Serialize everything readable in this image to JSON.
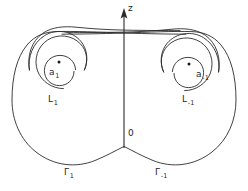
{
  "figure": {
    "kind": "contour-diagram",
    "background_color": "#ffffff",
    "stroke_color": "#2b2b2b",
    "width": 248,
    "height": 191,
    "axis": {
      "name": "z-axis",
      "label": "z",
      "origin_label": "0",
      "direction": "up",
      "has_arrowhead": true
    },
    "poles": [
      {
        "id": "a1",
        "label_base": "a",
        "label_sub": "1",
        "label": "a₁",
        "side": "left",
        "x": 58,
        "y": 64
      },
      {
        "id": "a-1",
        "label_base": "a",
        "label_sub": "-1",
        "label": "a₋₁",
        "side": "right",
        "x": 190,
        "y": 66
      }
    ],
    "loops": [
      {
        "id": "L1",
        "label_base": "L",
        "label_sub": "1",
        "label": "L₁",
        "side": "left",
        "description": "spiral loop around pole a1"
      },
      {
        "id": "L-1",
        "label_base": "L",
        "label_sub": "-1",
        "label": "L₋₁",
        "side": "right",
        "description": "spiral loop around pole a-1"
      }
    ],
    "contours": [
      {
        "id": "G1",
        "label_base": "Γ",
        "label_sub": "1",
        "label": "Γ₁",
        "side": "left",
        "description": "large outer contour on the left half-plane"
      },
      {
        "id": "G-1",
        "label_base": "Γ",
        "label_sub": "-1",
        "label": "Γ₋₁",
        "side": "right",
        "description": "large outer contour on the right half-plane"
      }
    ]
  },
  "labels": {
    "z_axis": "z",
    "origin": "0",
    "pole_left_base": "a",
    "pole_left_sub": "1",
    "pole_right_base": "a",
    "pole_right_sub": "-1",
    "loop_left_base": "L",
    "loop_left_sub": "1",
    "loop_right_base": "L",
    "loop_right_sub": "-1",
    "contour_left_base": "Γ",
    "contour_left_sub": "1",
    "contour_right_base": "Γ",
    "contour_right_sub": "-1"
  }
}
